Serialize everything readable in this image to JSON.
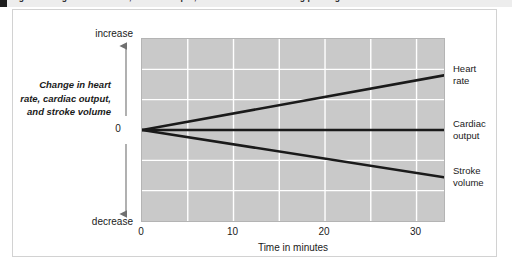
{
  "caption": {
    "text": "Figure  Changes in heart rate, cardiac output, and stroke volume during prolonged exercise"
  },
  "chart_data": {
    "type": "line",
    "title": "",
    "xlabel": "Time in minutes",
    "ylabel": "Change in heart rate, cardiac output, and stroke volume",
    "xlim": [
      0,
      33
    ],
    "ylim": [
      -1,
      1
    ],
    "xticks": [
      0,
      10,
      20,
      30
    ],
    "xtick_labels": [
      "0",
      "10",
      "20",
      "30"
    ],
    "ytick_labels": [
      "increase",
      "0",
      "decrease"
    ],
    "y_axis_top_label": "increase",
    "y_axis_zero_label": "0",
    "y_axis_bottom_label": "decrease",
    "grid": true,
    "grid_color": "#ffffff",
    "plot_background": "#c9c9c9",
    "line_color": "#1a1a1a",
    "legend_position": "right-inline",
    "x": [
      0,
      33
    ],
    "series": [
      {
        "name": "Heart rate",
        "label_line_1": "Heart",
        "label_line_2": "rate",
        "values": [
          0,
          0.6
        ]
      },
      {
        "name": "Cardiac output",
        "label_line_1": "Cardiac",
        "label_line_2": "output",
        "values": [
          0,
          0.0
        ]
      },
      {
        "name": "Stroke volume",
        "label_line_1": "Stroke",
        "label_line_2": "volume",
        "values": [
          0,
          -0.52
        ]
      }
    ]
  }
}
